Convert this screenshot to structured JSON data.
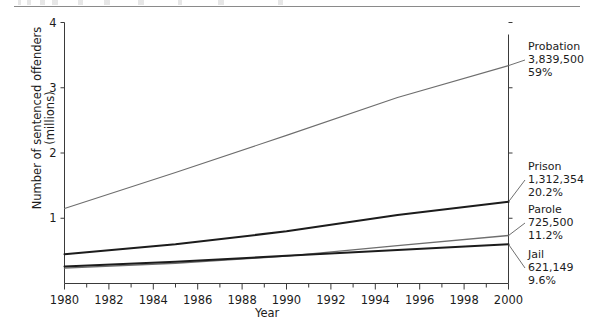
{
  "chart_data": {
    "type": "line",
    "title": "",
    "xlabel": "Year",
    "ylabel_line1": "Number of sentenced offenders",
    "ylabel_line2": "(millions)",
    "xlim": [
      1980,
      2000
    ],
    "ylim": [
      0,
      4
    ],
    "xticks": [
      1980,
      1982,
      1984,
      1986,
      1988,
      1990,
      1992,
      1994,
      1996,
      1998,
      2000
    ],
    "xtick_labels": [
      "1980",
      "1982",
      "1984",
      "1986",
      "1988",
      "1990",
      "1992",
      "1994",
      "1996",
      "1998",
      "2000"
    ],
    "yticks": [
      1,
      2,
      3,
      4
    ],
    "ytick_labels": [
      "1",
      "2",
      "3",
      "4"
    ],
    "grid": false,
    "legend_position": "right-annotations",
    "x": [
      1980,
      1985,
      1990,
      1995,
      2000
    ],
    "series": [
      {
        "name": "Probation",
        "color": "#6e6e6e",
        "width": 1.1,
        "values": [
          1.15,
          1.7,
          2.27,
          2.85,
          3.3395
        ],
        "end_label": "Probation",
        "end_count": "3,839,500",
        "end_pct": "59%"
      },
      {
        "name": "Prison",
        "color": "#1c1c1c",
        "width": 2.0,
        "values": [
          0.45,
          0.6,
          0.8,
          1.05,
          1.2515
        ],
        "end_label": "Prison",
        "end_count": "1,312,354",
        "end_pct": "20.2%"
      },
      {
        "name": "Parole",
        "color": "#6e6e6e",
        "width": 1.4,
        "values": [
          0.235,
          0.31,
          0.42,
          0.58,
          0.735
        ],
        "end_label": "Parole",
        "end_count": "725,500",
        "end_pct": "11.2%"
      },
      {
        "name": "Jail",
        "color": "#1c1c1c",
        "width": 2.0,
        "values": [
          0.26,
          0.335,
          0.425,
          0.515,
          0.6
        ],
        "end_label": "Jail",
        "end_count": "621,149",
        "end_pct": "9.6%"
      }
    ]
  }
}
